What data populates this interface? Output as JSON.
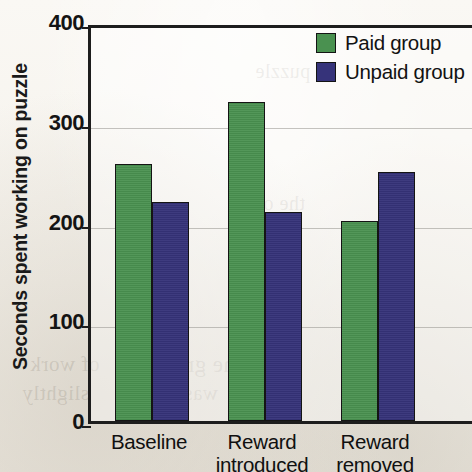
{
  "chart_data": {
    "type": "bar",
    "title": "",
    "subtitle": "",
    "xlabel": "",
    "ylabel": "Seconds spent working on puzzle",
    "categories": [
      "Baseline",
      "Reward introduced",
      "Reward removed"
    ],
    "category_lines": [
      [
        "Baseline",
        ""
      ],
      [
        "Reward",
        "introduced"
      ],
      [
        "Reward",
        "removed"
      ]
    ],
    "series": [
      {
        "name": "Paid group",
        "color": "#4a9150",
        "values": [
          258,
          320,
          201
        ]
      },
      {
        "name": "Unpaid group",
        "color": "#36337a",
        "values": [
          220,
          210,
          250
        ]
      }
    ],
    "ylim": [
      0,
      400
    ],
    "yticks": [
      0,
      100,
      200,
      300,
      400
    ],
    "ytick_labels": [
      "0",
      "100",
      "200",
      "300",
      "400"
    ],
    "grid": true,
    "grid_axis": "y",
    "legend_position": "top-right",
    "axis_color": "#1d1d1d",
    "background_color": "#f7f5f0"
  },
  "legend": {
    "items": [
      {
        "label": "Paid group",
        "color": "#4a9150"
      },
      {
        "label": "Unpaid group",
        "color": "#36337a"
      }
    ]
  },
  "ghost_text": {
    "a": "of work",
    "b": "slightly",
    "c": "One group",
    "d": "was paid",
    "e": "the other",
    "f": "puzzle"
  }
}
